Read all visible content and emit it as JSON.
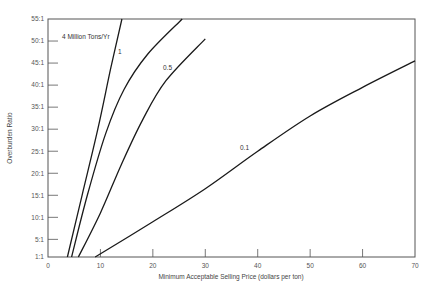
{
  "chart_data": {
    "type": "line",
    "title": "",
    "xlabel": "Minimum Acceptable Selling Price (dollars per ton)",
    "ylabel": "Overburden Ratio",
    "xlim": [
      0,
      70
    ],
    "ylim": [
      1,
      55
    ],
    "x_ticks": [
      0,
      10,
      20,
      30,
      40,
      50,
      60,
      70
    ],
    "x_tick_labels": [
      "0",
      "10",
      "20",
      "30",
      "40",
      "50",
      "60",
      "70"
    ],
    "y_ticks": [
      1,
      5,
      10,
      15,
      20,
      25,
      30,
      35,
      40,
      45,
      50,
      55
    ],
    "y_tick_labels": [
      "1:1",
      "5:1",
      "10:1",
      "15:1",
      "20:1",
      "25:1",
      "30:1",
      "35:1",
      "40:1",
      "45:1",
      "50:1",
      "55:1"
    ],
    "grid": false,
    "legend": "inline labels",
    "series": [
      {
        "name": "4 Million Tons/Yr",
        "label": "4 Million Tons/Yr",
        "x": [
          3.7,
          6.5,
          9.5,
          12.0,
          14.1
        ],
        "y": [
          1,
          15,
          30,
          44,
          55
        ]
      },
      {
        "name": "1",
        "label": "1",
        "x": [
          4.5,
          7.5,
          11.0,
          14.5,
          19.0,
          25.6
        ],
        "y": [
          1,
          15,
          29,
          39,
          47,
          55
        ]
      },
      {
        "name": "0.5",
        "label": "0.5",
        "x": [
          5.8,
          10.0,
          14.0,
          18.0,
          22.5,
          30.0
        ],
        "y": [
          1,
          11,
          22,
          32,
          41,
          50.5
        ]
      },
      {
        "name": "0.1",
        "label": "0.1",
        "x": [
          9.0,
          20.0,
          30.0,
          40.0,
          50.0,
          60.0,
          70.0
        ],
        "y": [
          1,
          9,
          16.5,
          25,
          33,
          39.5,
          45.5
        ]
      }
    ]
  }
}
